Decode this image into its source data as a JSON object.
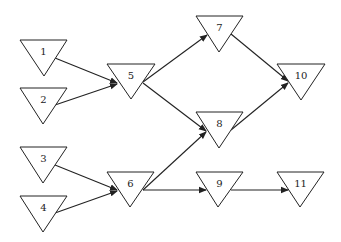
{
  "diagram": {
    "type": "directed-graph",
    "node_shape": "inverted-triangle",
    "colors": {
      "stroke": "#222222",
      "fill": "#ffffff",
      "background": "#ffffff"
    },
    "nodes": [
      {
        "id": "1",
        "label": "1",
        "left": 20,
        "right": 67,
        "top": 40,
        "apex_x": 44,
        "apex_y": 76
      },
      {
        "id": "2",
        "label": "2",
        "left": 20,
        "right": 67,
        "top": 88,
        "apex_x": 43,
        "apex_y": 124
      },
      {
        "id": "3",
        "label": "3",
        "left": 20,
        "right": 67,
        "top": 147,
        "apex_x": 43,
        "apex_y": 183
      },
      {
        "id": "4",
        "label": "4",
        "left": 20,
        "right": 67,
        "top": 196,
        "apex_x": 43,
        "apex_y": 232
      },
      {
        "id": "5",
        "label": "5",
        "left": 107,
        "right": 155,
        "top": 64,
        "apex_x": 131,
        "apex_y": 99
      },
      {
        "id": "6",
        "label": "6",
        "left": 107,
        "right": 154,
        "top": 172,
        "apex_x": 130,
        "apex_y": 207
      },
      {
        "id": "7",
        "label": "7",
        "left": 196,
        "right": 243,
        "top": 16,
        "apex_x": 219,
        "apex_y": 52
      },
      {
        "id": "8",
        "label": "8",
        "left": 196,
        "right": 243,
        "top": 112,
        "apex_x": 219,
        "apex_y": 148
      },
      {
        "id": "9",
        "label": "9",
        "left": 196,
        "right": 243,
        "top": 172,
        "apex_x": 218,
        "apex_y": 207
      },
      {
        "id": "10",
        "label": "10",
        "left": 277,
        "right": 325,
        "top": 64,
        "apex_x": 301,
        "apex_y": 100
      },
      {
        "id": "11",
        "label": "11",
        "left": 277,
        "right": 324,
        "top": 172,
        "apex_x": 300,
        "apex_y": 207
      }
    ],
    "edges": [
      {
        "from": "1",
        "to": "5",
        "x1": 55,
        "y1": 58,
        "x2": 117,
        "y2": 83
      },
      {
        "from": "2",
        "to": "5",
        "x1": 55,
        "y1": 105,
        "x2": 117,
        "y2": 84
      },
      {
        "from": "5",
        "to": "7",
        "x1": 143,
        "y1": 82,
        "x2": 207,
        "y2": 35
      },
      {
        "from": "5",
        "to": "8",
        "x1": 143,
        "y1": 83,
        "x2": 206,
        "y2": 131
      },
      {
        "from": "7",
        "to": "10",
        "x1": 231,
        "y1": 34,
        "x2": 288,
        "y2": 81
      },
      {
        "from": "8",
        "to": "10",
        "x1": 231,
        "y1": 130,
        "x2": 288,
        "y2": 83
      },
      {
        "from": "3",
        "to": "6",
        "x1": 55,
        "y1": 165,
        "x2": 117,
        "y2": 190
      },
      {
        "from": "4",
        "to": "6",
        "x1": 55,
        "y1": 213,
        "x2": 117,
        "y2": 191
      },
      {
        "from": "6",
        "to": "8",
        "x1": 143,
        "y1": 190,
        "x2": 206,
        "y2": 132
      },
      {
        "from": "6",
        "to": "9",
        "x1": 143,
        "y1": 190,
        "x2": 206,
        "y2": 190
      },
      {
        "from": "9",
        "to": "11",
        "x1": 231,
        "y1": 190,
        "x2": 288,
        "y2": 190
      }
    ]
  }
}
